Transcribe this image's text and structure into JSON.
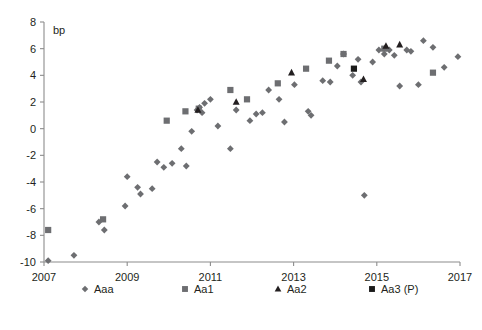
{
  "chart_data": {
    "type": "scatter",
    "title": "",
    "subtitle": "",
    "xlabel": "",
    "ylabel": "bp",
    "unit_label": "bp",
    "xlim": [
      2007,
      2017
    ],
    "ylim": [
      -10,
      8
    ],
    "xticks": [
      2007,
      2009,
      2011,
      2013,
      2015,
      2017
    ],
    "xtick_labels": [
      "2007",
      "2009",
      "2011",
      "2013",
      "2015",
      "2017"
    ],
    "yticks": [
      -10,
      -8,
      -6,
      -4,
      -2,
      0,
      2,
      4,
      6,
      8
    ],
    "ytick_labels": [
      "-10",
      "-8",
      "-6",
      "-4",
      "-2",
      "0",
      "2",
      "4",
      "6",
      "8"
    ],
    "grid": false,
    "legend_position": "bottom",
    "series": [
      {
        "name": "Aaa",
        "marker": "diamond",
        "color": "#6d6e71",
        "points": [
          [
            2007.1,
            -9.9
          ],
          [
            2007.72,
            -9.5
          ],
          [
            2008.32,
            -7.0
          ],
          [
            2008.45,
            -7.6
          ],
          [
            2008.95,
            -5.8
          ],
          [
            2009.0,
            -3.6
          ],
          [
            2009.25,
            -4.4
          ],
          [
            2009.32,
            -4.9
          ],
          [
            2009.6,
            -4.5
          ],
          [
            2009.72,
            -2.5
          ],
          [
            2009.88,
            -2.9
          ],
          [
            2010.08,
            -2.6
          ],
          [
            2010.42,
            -2.8
          ],
          [
            2010.3,
            -1.5
          ],
          [
            2010.55,
            -0.2
          ],
          [
            2010.68,
            1.4
          ],
          [
            2010.74,
            1.6
          ],
          [
            2010.8,
            1.2
          ],
          [
            2010.86,
            1.9
          ],
          [
            2011.0,
            2.2
          ],
          [
            2011.18,
            0.2
          ],
          [
            2011.48,
            -1.5
          ],
          [
            2011.62,
            1.4
          ],
          [
            2011.95,
            0.6
          ],
          [
            2012.1,
            1.1
          ],
          [
            2012.25,
            1.2
          ],
          [
            2012.4,
            2.9
          ],
          [
            2012.65,
            2.2
          ],
          [
            2012.78,
            0.5
          ],
          [
            2013.02,
            3.3
          ],
          [
            2013.35,
            1.3
          ],
          [
            2013.42,
            1.0
          ],
          [
            2013.7,
            3.6
          ],
          [
            2013.88,
            3.5
          ],
          [
            2014.05,
            4.7
          ],
          [
            2014.2,
            5.6
          ],
          [
            2014.42,
            4.0
          ],
          [
            2014.55,
            5.2
          ],
          [
            2014.62,
            3.5
          ],
          [
            2014.7,
            -5.0
          ],
          [
            2014.9,
            5.0
          ],
          [
            2015.05,
            5.9
          ],
          [
            2015.18,
            5.6
          ],
          [
            2015.3,
            5.9
          ],
          [
            2015.42,
            5.5
          ],
          [
            2015.55,
            3.2
          ],
          [
            2015.72,
            5.9
          ],
          [
            2015.82,
            5.8
          ],
          [
            2016.0,
            3.3
          ],
          [
            2016.12,
            6.6
          ],
          [
            2016.35,
            6.1
          ],
          [
            2016.62,
            4.6
          ],
          [
            2016.95,
            5.4
          ]
        ]
      },
      {
        "name": "Aa1",
        "marker": "square",
        "color": "#6d6e71",
        "points": [
          [
            2007.1,
            -7.6
          ],
          [
            2008.42,
            -6.8
          ],
          [
            2009.95,
            0.6
          ],
          [
            2010.4,
            1.3
          ],
          [
            2010.72,
            1.5
          ],
          [
            2011.48,
            2.9
          ],
          [
            2011.88,
            2.2
          ],
          [
            2012.62,
            3.4
          ],
          [
            2013.3,
            4.5
          ],
          [
            2013.85,
            5.1
          ],
          [
            2014.2,
            5.6
          ],
          [
            2015.18,
            6.0
          ],
          [
            2016.35,
            4.2
          ]
        ]
      },
      {
        "name": "Aa2",
        "marker": "triangle",
        "color": "#231f20",
        "points": [
          [
            2010.7,
            1.4
          ],
          [
            2011.62,
            2.0
          ],
          [
            2012.95,
            4.2
          ],
          [
            2014.68,
            3.7
          ],
          [
            2015.22,
            6.2
          ],
          [
            2015.55,
            6.3
          ]
        ]
      },
      {
        "name": "Aa3 (P)",
        "marker": "square",
        "color": "#1a1a1a",
        "points": [
          [
            2014.45,
            4.5
          ]
        ]
      }
    ]
  },
  "legend": {
    "items": [
      {
        "label": "Aaa",
        "marker": "diamond",
        "color": "#6d6e71"
      },
      {
        "label": "Aa1",
        "marker": "square",
        "color": "#6d6e71"
      },
      {
        "label": "Aa2",
        "marker": "triangle",
        "color": "#231f20"
      },
      {
        "label": "Aa3 (P)",
        "marker": "square",
        "color": "#1a1a1a"
      }
    ]
  },
  "colors": {
    "axis": "#8c8c8c",
    "text": "#231f20",
    "series_gray": "#6d6e71",
    "series_black": "#1a1a1a",
    "background": "#ffffff"
  }
}
